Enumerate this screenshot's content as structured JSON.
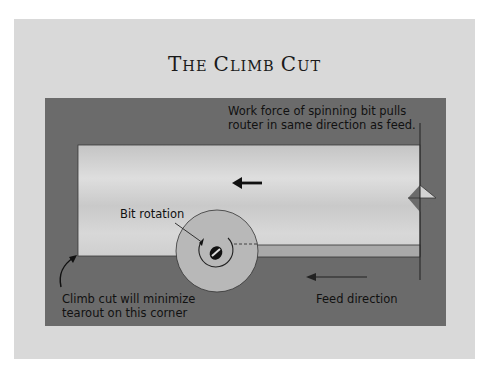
{
  "title": {
    "word1_cap": "T",
    "word1_rest": "HE",
    "word2_cap": "C",
    "word2_rest": "LIMB",
    "word3_cap": "C",
    "word3_rest": "UT"
  },
  "labels": {
    "work_force_line1": "Work force of spinning bit pulls",
    "work_force_line2": "router in same direction as feed.",
    "bit_rotation": "Bit rotation",
    "climb_cut_line1": "Climb cut will minimize",
    "climb_cut_line2": "tearout on this corner",
    "feed_direction": "Feed direction"
  },
  "icons": {
    "work_force_arrow": "arrow-left-bold",
    "feed_arrow": "arrow-left-thin",
    "corner_arrow": "curved-arrow-up-right",
    "bit": "router-bit-circle"
  },
  "colors": {
    "page": "#ffffff",
    "outer_panel": "#d9d9d9",
    "dark_panel": "#6b6b6b",
    "board_light": "#cfcfcf",
    "board_strip": "#a9a9a9",
    "router_base": "#b8b8b8",
    "ink": "#111111"
  }
}
